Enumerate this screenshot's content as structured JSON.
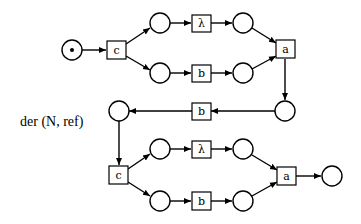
{
  "caption": "der (N, ref)",
  "colors": {
    "stroke": "#000000",
    "background": "#ffffff"
  },
  "top_net": {
    "start_place": {
      "token": true
    },
    "transitions": {
      "choice": "c",
      "upper": "λ",
      "lower": "b",
      "join": "a",
      "back": "b"
    }
  },
  "bottom_net": {
    "transitions": {
      "choice": "c",
      "upper": "λ",
      "lower": "b",
      "join": "a"
    },
    "final_place": {
      "token": false
    }
  }
}
